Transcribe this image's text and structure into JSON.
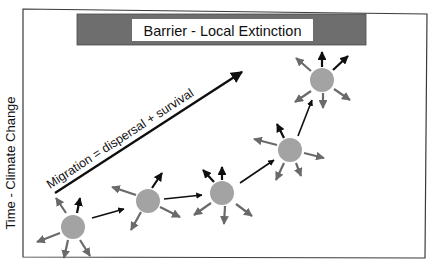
{
  "diagram": {
    "title_box": {
      "label": "Barrier - Local Extinction",
      "bar_color": "#6e6e6e"
    },
    "y_axis_label": "Time - Climate Change",
    "migration_label": "Migration = dispersal + survival",
    "colors": {
      "population": "#a3a3a3",
      "successful_dispersal": "#0f0f0f",
      "failed_dispersal": "#6a6a6a"
    },
    "populations": [
      {
        "id": 1,
        "cx": 73,
        "cy": 227
      },
      {
        "id": 2,
        "cx": 148,
        "cy": 201
      },
      {
        "id": 3,
        "cx": 222,
        "cy": 193
      },
      {
        "id": 4,
        "cx": 290,
        "cy": 150
      },
      {
        "id": 5,
        "cx": 322,
        "cy": 80
      }
    ]
  }
}
